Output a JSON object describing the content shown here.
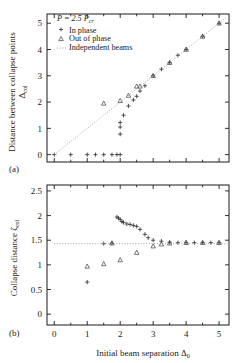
{
  "figure": {
    "panel_a_label": "(a)",
    "panel_b_label": "(b)"
  },
  "legend": {
    "condition": "P = 2.5 P",
    "condition_sub": "cr",
    "items": [
      {
        "label": "In phase",
        "marker": "plus",
        "color": "#2b2b2b"
      },
      {
        "label": "Out of phase",
        "marker": "triangle",
        "color": "#4a4a4a"
      },
      {
        "label": "Independent beams",
        "marker": "dotted-line",
        "color": "#9a9a9a"
      }
    ]
  },
  "axes": {
    "x_title": "Initial beam separation Δ",
    "x_title_sub": "0",
    "y_title_a_line1": "Distance between collapse points",
    "y_title_a_line2": "Δ",
    "y_title_a_sub": "col",
    "y_title_b": "Collapse distance ζ",
    "y_title_b_sub": "col",
    "x_ticks": [
      0,
      1,
      2,
      3,
      4,
      5
    ],
    "y_ticks_a": [
      0,
      1,
      2,
      3,
      4,
      5
    ],
    "y_ticks_b": [
      "0",
      "0.5",
      "1",
      "1.5",
      "2",
      "2.5"
    ],
    "x_range": [
      -0.22,
      5.3
    ],
    "y_range_a": [
      -0.28,
      5.35
    ],
    "y_range_b": [
      -0.22,
      2.62
    ]
  },
  "chart_data": [
    {
      "type": "scatter",
      "panel": "a",
      "title": "",
      "xlabel": "Initial beam separation Δ0",
      "ylabel": "Distance between collapse points Δcol",
      "xlim": [
        -0.22,
        5.3
      ],
      "ylim": [
        -0.28,
        5.35
      ],
      "grid": false,
      "legend_position": "upper-left",
      "annotation": "P = 2.5 Pcr",
      "series": [
        {
          "name": "In phase",
          "marker": "plus",
          "x": [
            0.0,
            0.5,
            1.0,
            1.25,
            1.5,
            1.75,
            1.9,
            2.0,
            2.0,
            2.0,
            2.0,
            2.1,
            2.25,
            2.4,
            2.5,
            2.6,
            2.75,
            3.0,
            3.25,
            3.5,
            3.75,
            4.0,
            4.5,
            5.0
          ],
          "y": [
            0.0,
            0.0,
            0.0,
            0.0,
            0.0,
            0.0,
            0.0,
            0.0,
            0.78,
            1.05,
            1.22,
            1.5,
            1.85,
            2.08,
            2.22,
            2.42,
            2.62,
            3.0,
            3.25,
            3.5,
            3.78,
            4.0,
            4.5,
            5.0
          ]
        },
        {
          "name": "Out of phase",
          "marker": "triangle",
          "x": [
            1.5,
            2.0,
            2.25,
            2.5,
            2.6,
            3.0,
            3.5,
            4.0,
            4.5,
            5.0
          ],
          "y": [
            1.95,
            2.05,
            2.25,
            2.6,
            2.6,
            3.0,
            3.5,
            4.0,
            4.5,
            5.0
          ]
        },
        {
          "name": "Independent beams",
          "marker": "dotted-line",
          "x": [
            0.0,
            5.25
          ],
          "y": [
            0.0,
            5.25
          ]
        }
      ]
    },
    {
      "type": "scatter",
      "panel": "b",
      "title": "",
      "xlabel": "Initial beam separation Δ0",
      "ylabel": "Collapse distance ζcol",
      "xlim": [
        -0.22,
        5.3
      ],
      "ylim": [
        -0.22,
        2.62
      ],
      "grid": false,
      "legend_position": "none",
      "series": [
        {
          "name": "In phase",
          "marker": "plus",
          "x": [
            1.0,
            1.5,
            1.75,
            1.9,
            1.95,
            2.0,
            2.05,
            2.1,
            2.2,
            2.3,
            2.4,
            2.5,
            2.6,
            2.75,
            2.85,
            3.0,
            3.25,
            3.5,
            3.75,
            4.0,
            4.25,
            4.5,
            4.75,
            5.0
          ],
          "y": [
            0.65,
            1.43,
            1.44,
            1.97,
            1.95,
            1.92,
            1.88,
            1.86,
            1.83,
            1.82,
            1.8,
            1.78,
            1.72,
            1.62,
            1.55,
            1.5,
            1.48,
            1.46,
            1.45,
            1.45,
            1.45,
            1.45,
            1.45,
            1.45
          ]
        },
        {
          "name": "Out of phase",
          "marker": "triangle",
          "x": [
            1.0,
            1.5,
            1.75,
            2.0,
            2.5,
            3.0,
            3.25,
            3.5,
            4.0,
            4.5,
            5.0
          ],
          "y": [
            0.97,
            1.02,
            1.44,
            1.1,
            1.25,
            1.38,
            1.42,
            1.44,
            1.45,
            1.45,
            1.45
          ]
        },
        {
          "name": "Independent beams",
          "marker": "dotted-line",
          "x": [
            0.0,
            5.25
          ],
          "y": [
            1.43,
            1.43
          ]
        }
      ]
    }
  ]
}
